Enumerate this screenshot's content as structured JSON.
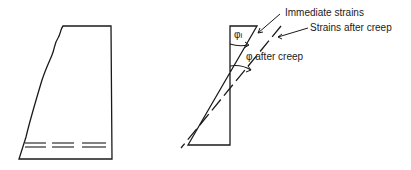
{
  "figure": {
    "left_panel": {
      "description": "Column section with cracked tension face and reinforcement"
    },
    "right_panel": {
      "labels": {
        "immediate_strains": "Immediate strains",
        "strains_after_creep": "Strains after creep",
        "phi_i": "φ",
        "phi_i_sub": "i",
        "phi_after_creep": "φ after creep"
      }
    }
  },
  "colors": {
    "line": "#1a1a1a",
    "background": "#ffffff"
  }
}
